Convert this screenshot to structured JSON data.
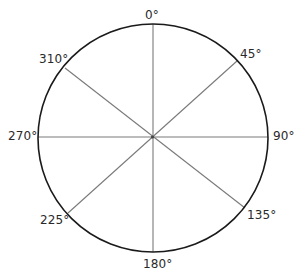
{
  "diagram": {
    "type": "compass-rose",
    "colors": {
      "background": "#ffffff",
      "circle_stroke": "#1a1a1a",
      "spoke_stroke": "#7a7a7a",
      "label_text": "#2a2a2a"
    },
    "labels": [
      {
        "id": "deg-0",
        "text": "0°",
        "angle": 0
      },
      {
        "id": "deg-45",
        "text": "45°",
        "angle": 45
      },
      {
        "id": "deg-90",
        "text": "90°",
        "angle": 90
      },
      {
        "id": "deg-135",
        "text": "135°",
        "angle": 135
      },
      {
        "id": "deg-180",
        "text": "180°",
        "angle": 180
      },
      {
        "id": "deg-225",
        "text": "225°",
        "angle": 225
      },
      {
        "id": "deg-270",
        "text": "270°",
        "angle": 270
      },
      {
        "id": "deg-310",
        "text": "310°",
        "angle": 315
      }
    ]
  }
}
